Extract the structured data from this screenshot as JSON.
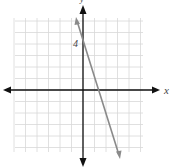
{
  "chart_data": {
    "type": "line",
    "title": "",
    "xlabel": "x",
    "ylabel": "y",
    "xlim": [
      -6,
      5.5
    ],
    "ylim": [
      -5.5,
      6.2
    ],
    "grid": true,
    "legend": null,
    "annotations": [
      {
        "text": "4",
        "x": -0.2,
        "y": 4
      }
    ],
    "series": [
      {
        "name": "line",
        "equation": "y = -3x + 4",
        "x": [
          -0.67,
          0,
          1.33,
          3.33
        ],
        "y": [
          6,
          4,
          0,
          -6
        ],
        "color": "#888888",
        "arrows": "both"
      }
    ]
  },
  "labels": {
    "x_axis": "x",
    "y_axis": "y",
    "tick_4": "4"
  },
  "colors": {
    "grid": "#d8d8d8",
    "axis": "#111111",
    "line": "#8a8a8a"
  }
}
